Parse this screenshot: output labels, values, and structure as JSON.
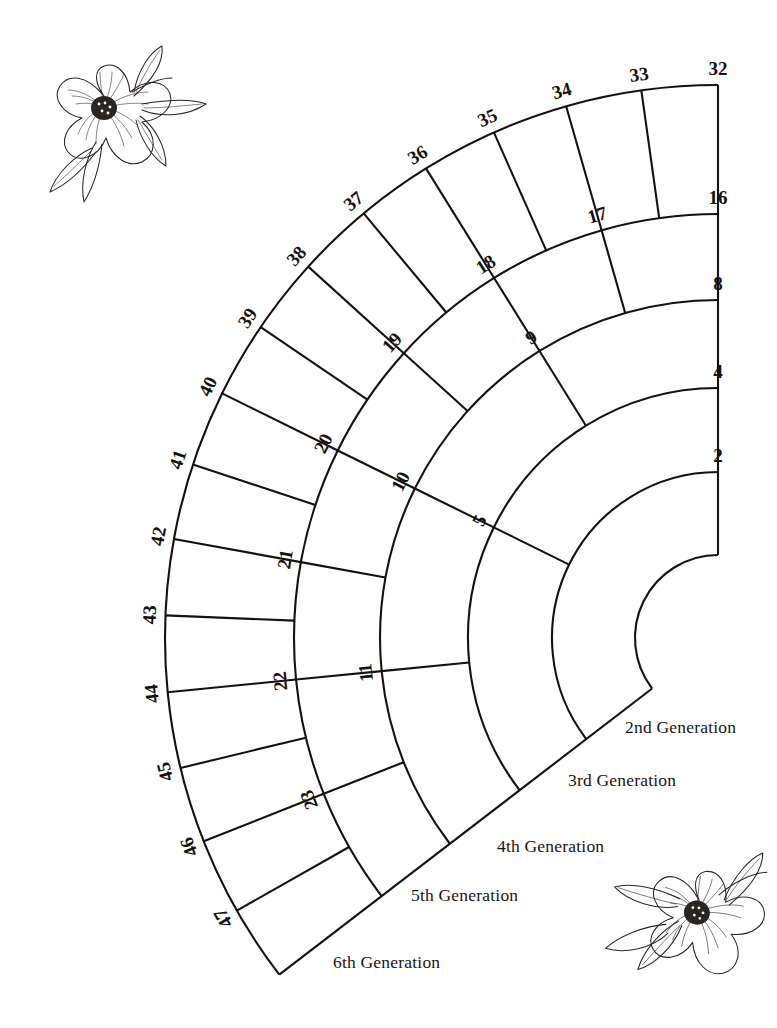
{
  "document": {
    "type": "fan-chart",
    "title": "Six Generation Ancestor Fan Chart"
  },
  "chart_data": {
    "type": "fan",
    "center": {
      "x": 718,
      "y": 638
    },
    "start_angle_deg": 0,
    "sweep_deg": 127.5,
    "ring_radii": [
      83,
      166,
      250,
      338,
      424,
      553
    ],
    "rings": [
      {
        "generation": 2,
        "count": 1,
        "numbers": [
          2
        ]
      },
      {
        "generation": 3,
        "count": 2,
        "numbers": [
          4,
          5
        ]
      },
      {
        "generation": 4,
        "count": 4,
        "numbers": [
          8,
          9,
          10,
          11
        ]
      },
      {
        "generation": 5,
        "count": 8,
        "numbers": [
          16,
          17,
          18,
          19,
          20,
          21,
          22,
          23
        ]
      },
      {
        "generation": 6,
        "count": 16,
        "numbers": [
          32,
          33,
          34,
          35,
          36,
          37,
          38,
          39,
          40,
          41,
          42,
          43,
          44,
          45,
          46,
          47
        ]
      }
    ]
  },
  "generation_labels": [
    {
      "text": "2nd Generation",
      "x": 625,
      "y": 733
    },
    {
      "text": "3rd Generation",
      "x": 568,
      "y": 786
    },
    {
      "text": "4th Generation",
      "x": 497,
      "y": 852
    },
    {
      "text": "5th Generation",
      "x": 411,
      "y": 901
    },
    {
      "text": "6th Generation",
      "x": 333,
      "y": 968
    }
  ],
  "decorations": [
    {
      "name": "flower-top-left",
      "x": 40,
      "y": 30,
      "scale": 1.0,
      "rotation": 0
    },
    {
      "name": "flower-bottom-right",
      "x": 630,
      "y": 820,
      "scale": 1.05,
      "rotation": 15
    }
  ],
  "colors": {
    "ink": "#15110f",
    "paper": "#ffffff",
    "flower": "#2b2522"
  }
}
